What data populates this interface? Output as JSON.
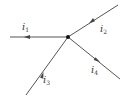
{
  "diagram": {
    "type": "circuit-node",
    "line_color": "#555555",
    "node": {
      "x": 68,
      "y": 37
    },
    "branches": [
      {
        "id": "i1",
        "label": "i",
        "subscript": "1",
        "end": {
          "x": 10,
          "y": 37
        },
        "direction": "out",
        "label_pos": {
          "x": 22,
          "y": 22
        }
      },
      {
        "id": "i2",
        "label": "i",
        "subscript": "2",
        "end": {
          "x": 118,
          "y": 5
        },
        "direction": "in",
        "label_pos": {
          "x": 100,
          "y": 24
        }
      },
      {
        "id": "i3",
        "label": "i",
        "subscript": "3",
        "end": {
          "x": 26,
          "y": 95
        },
        "direction": "in",
        "label_pos": {
          "x": 43,
          "y": 75
        }
      },
      {
        "id": "i4",
        "label": "i",
        "subscript": "4",
        "end": {
          "x": 120,
          "y": 79
        },
        "direction": "out",
        "label_pos": {
          "x": 91,
          "y": 65
        }
      }
    ]
  }
}
